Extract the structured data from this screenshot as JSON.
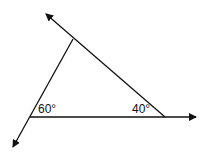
{
  "diagram": {
    "type": "geometry-triangle-with-extended-sides",
    "angles": [
      {
        "label": "60°",
        "vertex": "left"
      },
      {
        "label": "40°",
        "vertex": "right"
      }
    ],
    "line_color": "#111111",
    "background": "#ffffff"
  }
}
